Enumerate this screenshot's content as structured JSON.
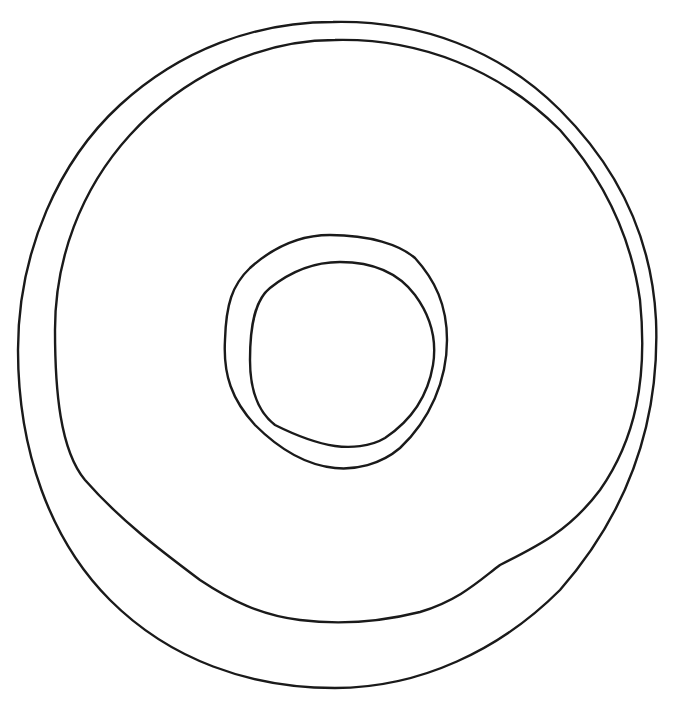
{
  "drawing": {
    "subject": "donut",
    "style": "line-art",
    "background_color": "#ffffff",
    "stroke_color": "#1a1a1a",
    "parts": [
      "outer-edge",
      "icing-edge",
      "hole-outer-edge",
      "hole-inner-edge"
    ]
  }
}
